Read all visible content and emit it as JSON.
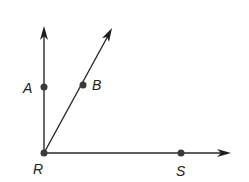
{
  "diagram": {
    "vertex": "R",
    "points": {
      "A": "A",
      "B": "B",
      "R": "R",
      "S": "S"
    },
    "rays": [
      {
        "name": "ray-RA",
        "from": "R",
        "through": "A"
      },
      {
        "name": "ray-RB",
        "from": "R",
        "through": "B"
      },
      {
        "name": "ray-RS",
        "from": "R",
        "through": "S"
      }
    ],
    "colors": {
      "stroke": "#2a2a2a",
      "point": "#3a3a3a",
      "background": "#ffffff"
    }
  }
}
